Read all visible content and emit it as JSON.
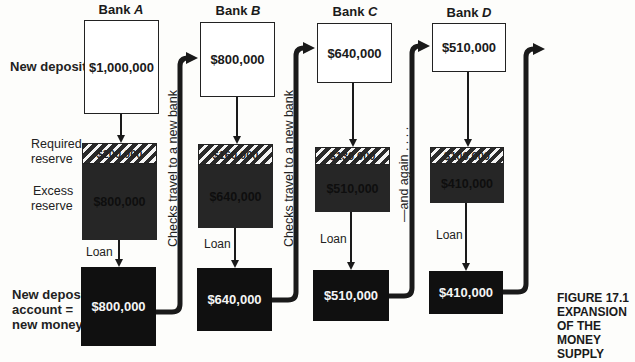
{
  "figure": {
    "caption_lines": [
      "FIGURE 17.1",
      "EXPANSION",
      "OF THE",
      "MONEY",
      "SUPPLY"
    ]
  },
  "row_labels": {
    "new_deposits": "New deposits",
    "required_reserve_lines": [
      "Required",
      "reserve"
    ],
    "excess_reserve_lines": [
      "Excess",
      "reserve"
    ],
    "new_money_lines": [
      "New deposit",
      "account =",
      "new money"
    ],
    "loan": "Loan"
  },
  "connectors": {
    "checks_travel": "Checks travel to a new bank",
    "and_again": "—and again . . . ."
  },
  "banks": [
    {
      "prefix": "Bank ",
      "letter": "A",
      "new_deposit": "$1,000,000",
      "required_reserve": "$200,000",
      "excess_reserve": "$800,000",
      "loan_deposit": "$800,000"
    },
    {
      "prefix": "Bank ",
      "letter": "B",
      "new_deposit": "$800,000",
      "required_reserve": "$160,000",
      "excess_reserve": "$640,000",
      "loan_deposit": "$640,000"
    },
    {
      "prefix": "Bank ",
      "letter": "C",
      "new_deposit": "$640,000",
      "required_reserve": "$130,000",
      "excess_reserve": "$510,000",
      "loan_deposit": "$510,000"
    },
    {
      "prefix": "Bank ",
      "letter": "D",
      "new_deposit": "$510,000",
      "required_reserve": "$100,000",
      "excess_reserve": "$410,000",
      "loan_deposit": "$410,000"
    }
  ],
  "colors": {
    "ink": "#1a1a1a",
    "excess_fill": "#262626",
    "new_money_fill": "#101010",
    "paper": "#fdfdfb"
  }
}
